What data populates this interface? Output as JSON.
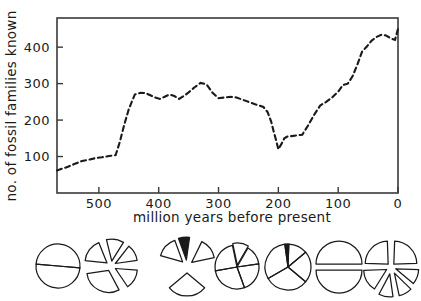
{
  "figure": {
    "ylabel": "no. of fossil families known",
    "xlabel": "million years before present"
  },
  "chart_data": {
    "type": "line",
    "title": "",
    "xlabel": "million years before present",
    "ylabel": "no. of fossil families known",
    "xlim": [
      570,
      0
    ],
    "ylim": [
      0,
      480
    ],
    "x_reversed": true,
    "grid": false,
    "legend": null,
    "line_style": "dashed",
    "line_color": "#1a1a1a",
    "xticks": [
      500,
      400,
      300,
      200,
      100,
      0
    ],
    "xtick_labels": [
      "500",
      "400",
      "300",
      "200",
      "100",
      "0"
    ],
    "yticks": [
      100,
      200,
      300,
      400
    ],
    "ytick_labels": [
      "100",
      "200",
      "300",
      "400"
    ],
    "x": [
      570,
      555,
      540,
      528,
      515,
      505,
      495,
      488,
      480,
      472,
      465,
      458,
      450,
      440,
      430,
      422,
      414,
      406,
      398,
      390,
      382,
      374,
      366,
      358,
      350,
      340,
      330,
      320,
      310,
      300,
      290,
      280,
      270,
      260,
      250,
      240,
      232,
      225,
      218,
      212,
      208,
      204,
      200,
      195,
      190,
      185,
      178,
      170,
      160,
      150,
      140,
      130,
      120,
      110,
      100,
      92,
      84,
      76,
      68,
      60,
      52,
      44,
      36,
      28,
      20,
      12,
      5,
      0
    ],
    "y": [
      62,
      70,
      80,
      88,
      92,
      96,
      98,
      100,
      102,
      104,
      140,
      185,
      230,
      270,
      275,
      274,
      268,
      262,
      258,
      264,
      270,
      266,
      258,
      266,
      276,
      290,
      302,
      298,
      275,
      260,
      262,
      264,
      262,
      256,
      250,
      244,
      240,
      236,
      222,
      196,
      170,
      146,
      120,
      134,
      150,
      155,
      156,
      158,
      160,
      186,
      215,
      240,
      250,
      262,
      278,
      296,
      300,
      320,
      352,
      388,
      402,
      418,
      428,
      434,
      432,
      424,
      420,
      450
    ],
    "annotation": "Number of known fossil families over the Phanerozoic, showing mass-extinction drops near 250 and 65 million years before present."
  },
  "pies": [
    {
      "name": "pie-1",
      "style": "whole-circle-with-diameter",
      "cx": 58,
      "cy": 266,
      "r": 22,
      "wedges": [
        {
          "start": 5,
          "end": 185,
          "explode": 0,
          "fill": "none"
        },
        {
          "start": 185,
          "end": 365,
          "explode": 0,
          "fill": "none"
        }
      ]
    },
    {
      "name": "pie-2",
      "style": "exploded",
      "cx": 111,
      "cy": 266,
      "r": 22,
      "wedges": [
        {
          "start": 256,
          "end": 302,
          "explode": 5,
          "fill": "none"
        },
        {
          "start": 308,
          "end": 352,
          "explode": 5,
          "fill": "none"
        },
        {
          "start": 4,
          "end": 56,
          "explode": 5,
          "fill": "none"
        },
        {
          "start": 62,
          "end": 172,
          "explode": 5,
          "fill": "none"
        },
        {
          "start": 186,
          "end": 248,
          "explode": 5,
          "fill": "none"
        }
      ]
    },
    {
      "name": "pie-3",
      "style": "exploded",
      "cx": 187,
      "cy": 266,
      "r": 23,
      "wedges": [
        {
          "start": 196,
          "end": 250,
          "explode": 6,
          "fill": "none"
        },
        {
          "start": 250,
          "end": 278,
          "explode": 6,
          "fill": "#1a1a1a"
        },
        {
          "start": 296,
          "end": 348,
          "explode": 6,
          "fill": "none"
        },
        {
          "start": 40,
          "end": 140,
          "explode": 7,
          "fill": "none"
        }
      ]
    },
    {
      "name": "pie-4",
      "style": "whole-circle-divided",
      "cx": 237,
      "cy": 267,
      "r": 22,
      "wedges": [
        {
          "start": 258,
          "end": 300,
          "explode": 2,
          "fill": "none"
        },
        {
          "start": 300,
          "end": 352,
          "explode": 0,
          "fill": "none"
        },
        {
          "start": 352,
          "end": 70,
          "explode": 0,
          "fill": "none"
        },
        {
          "start": 70,
          "end": 170,
          "explode": 0,
          "fill": "none"
        },
        {
          "start": 170,
          "end": 258,
          "explode": 0,
          "fill": "none"
        }
      ]
    },
    {
      "name": "pie-5",
      "style": "whole-circle-divided",
      "cx": 288,
      "cy": 267,
      "r": 23,
      "wedges": [
        {
          "start": 262,
          "end": 272,
          "explode": 0,
          "fill": "#1a1a1a"
        },
        {
          "start": 272,
          "end": 320,
          "explode": 0,
          "fill": "none"
        },
        {
          "start": 320,
          "end": 40,
          "explode": 0,
          "fill": "none"
        },
        {
          "start": 40,
          "end": 150,
          "explode": 0,
          "fill": "none"
        },
        {
          "start": 150,
          "end": 262,
          "explode": 0,
          "fill": "none"
        }
      ]
    },
    {
      "name": "pie-6",
      "style": "split-halves",
      "cx": 339,
      "cy": 267,
      "r": 23,
      "wedges": [
        {
          "start": 180,
          "end": 360,
          "explode": 3,
          "fill": "none"
        },
        {
          "start": 0,
          "end": 180,
          "explode": 3,
          "fill": "none"
        }
      ]
    },
    {
      "name": "pie-7",
      "style": "exploded-quadrants",
      "cx": 391,
      "cy": 267,
      "r": 23,
      "wedges": [
        {
          "start": 182,
          "end": 268,
          "explode": 4,
          "fill": "none"
        },
        {
          "start": 272,
          "end": 358,
          "explode": 4,
          "fill": "none"
        },
        {
          "start": 2,
          "end": 40,
          "explode": 5,
          "fill": "none"
        },
        {
          "start": 44,
          "end": 78,
          "explode": 7,
          "fill": "none"
        },
        {
          "start": 82,
          "end": 118,
          "explode": 7,
          "fill": "none"
        },
        {
          "start": 122,
          "end": 178,
          "explode": 5,
          "fill": "none"
        }
      ]
    }
  ],
  "plot_box": {
    "left": 57,
    "top": 18,
    "right": 398,
    "bottom": 193
  }
}
